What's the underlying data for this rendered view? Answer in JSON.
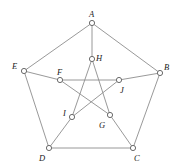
{
  "figure": {
    "width": 174,
    "height": 168,
    "background_color": "#ffffff",
    "edge_color": "#8d8d8d",
    "node_stroke_color": "#6b6b6b",
    "node_fill_color": "#ffffff",
    "label_color": "#1a1a1a"
  },
  "chart_data": {
    "type": "diagram",
    "subtype": "graph",
    "nodes": [
      {
        "id": "A",
        "label": "A",
        "x": 92,
        "y": 23,
        "label_x": 89,
        "label_y": 10,
        "ring": "outer"
      },
      {
        "id": "B",
        "label": "B",
        "x": 160,
        "y": 73,
        "label_x": 164,
        "label_y": 63,
        "ring": "outer"
      },
      {
        "id": "C",
        "label": "C",
        "x": 133,
        "y": 148,
        "label_x": 134,
        "label_y": 154,
        "ring": "outer"
      },
      {
        "id": "D",
        "label": "D",
        "x": 49,
        "y": 148,
        "label_x": 39,
        "label_y": 154,
        "ring": "outer"
      },
      {
        "id": "E",
        "label": "E",
        "x": 24,
        "y": 71,
        "label_x": 12,
        "label_y": 62,
        "ring": "outer"
      },
      {
        "id": "F",
        "label": "F",
        "x": 60,
        "y": 80,
        "label_x": 57,
        "label_y": 68,
        "ring": "inner"
      },
      {
        "id": "G",
        "label": "G",
        "x": 110,
        "y": 115,
        "label_x": 99,
        "label_y": 121,
        "ring": "inner"
      },
      {
        "id": "H",
        "label": "H",
        "x": 92,
        "y": 59,
        "label_x": 96,
        "label_y": 54,
        "ring": "inner"
      },
      {
        "id": "I",
        "label": "I",
        "x": 72,
        "y": 117,
        "label_x": 63,
        "label_y": 109,
        "ring": "inner"
      },
      {
        "id": "J",
        "label": "J",
        "x": 119,
        "y": 80,
        "label_x": 120,
        "label_y": 86,
        "ring": "inner"
      }
    ],
    "edges": [
      {
        "from": "A",
        "to": "B",
        "kind": "outer-cycle"
      },
      {
        "from": "B",
        "to": "C",
        "kind": "outer-cycle"
      },
      {
        "from": "C",
        "to": "D",
        "kind": "outer-cycle"
      },
      {
        "from": "D",
        "to": "E",
        "kind": "outer-cycle"
      },
      {
        "from": "E",
        "to": "A",
        "kind": "outer-cycle"
      },
      {
        "from": "A",
        "to": "H",
        "kind": "spoke"
      },
      {
        "from": "B",
        "to": "J",
        "kind": "spoke"
      },
      {
        "from": "C",
        "to": "G",
        "kind": "spoke"
      },
      {
        "from": "D",
        "to": "I",
        "kind": "spoke"
      },
      {
        "from": "E",
        "to": "F",
        "kind": "spoke"
      },
      {
        "from": "F",
        "to": "J",
        "kind": "pentagram"
      },
      {
        "from": "J",
        "to": "I",
        "kind": "pentagram"
      },
      {
        "from": "I",
        "to": "H",
        "kind": "pentagram"
      },
      {
        "from": "H",
        "to": "G",
        "kind": "pentagram"
      },
      {
        "from": "G",
        "to": "F",
        "kind": "pentagram"
      }
    ],
    "node_radius": 2.6,
    "node_count": 10,
    "edge_count": 15
  }
}
